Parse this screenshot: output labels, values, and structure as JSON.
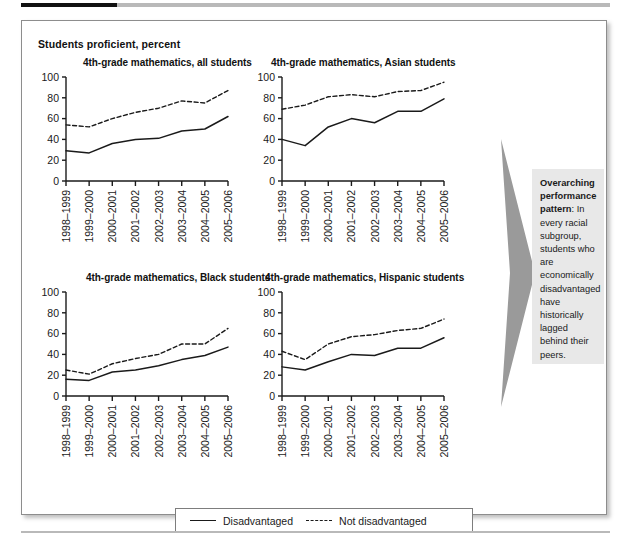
{
  "figure": {
    "axis_super_label": "Students proficient, percent",
    "legend": {
      "disadvantaged_label": "Disadvantaged",
      "not_disadvantaged_label": "Not disadvantaged"
    },
    "callout": {
      "lead": "Overarching performance pattern",
      "body": ": In every racial subgroup, students who are economically disadvantaged have historically lagged behind their peers."
    },
    "colors": {
      "line": "#1a1a1a",
      "arrow": "#9a9a9a",
      "callout_bg": "#e8e8e8",
      "rule_dark": "#111111",
      "rule_light": "#b9b9b9"
    }
  },
  "chart_data": [
    {
      "type": "line",
      "title": "4th-grade mathematics, all students",
      "xlabel": "",
      "ylabel": "Students proficient, percent",
      "ylim": [
        0,
        100
      ],
      "yticks": [
        0,
        20,
        40,
        60,
        80,
        100
      ],
      "grid": false,
      "legend_position": "below-figure",
      "categories": [
        "1998–1999",
        "1999–2000",
        "2000–2001",
        "2001–2002",
        "2002–2003",
        "2003–2004",
        "2004–2005",
        "2005–2006"
      ],
      "series": [
        {
          "name": "Disadvantaged",
          "style": "solid",
          "values": [
            29,
            27,
            36,
            40,
            41,
            48,
            50,
            62
          ]
        },
        {
          "name": "Not disadvantaged",
          "style": "dashed",
          "values": [
            54,
            52,
            60,
            66,
            70,
            77,
            75,
            87
          ]
        }
      ]
    },
    {
      "type": "line",
      "title": "4th-grade mathematics, Asian students",
      "xlabel": "",
      "ylabel": "Students proficient, percent",
      "ylim": [
        0,
        100
      ],
      "yticks": [
        0,
        20,
        40,
        60,
        80,
        100
      ],
      "grid": false,
      "legend_position": "below-figure",
      "categories": [
        "1998–1999",
        "1999–2000",
        "2000–2001",
        "2001–2002",
        "2002–2003",
        "2003–2004",
        "2004–2005",
        "2005–2006"
      ],
      "series": [
        {
          "name": "Disadvantaged",
          "style": "solid",
          "values": [
            40,
            34,
            52,
            60,
            56,
            67,
            67,
            79
          ]
        },
        {
          "name": "Not disadvantaged",
          "style": "dashed",
          "values": [
            69,
            73,
            81,
            83,
            81,
            86,
            87,
            95
          ]
        }
      ]
    },
    {
      "type": "line",
      "title": "4th-grade mathematics, Black students",
      "xlabel": "",
      "ylabel": "Students proficient, percent",
      "ylim": [
        0,
        100
      ],
      "yticks": [
        0,
        20,
        40,
        60,
        80,
        100
      ],
      "grid": false,
      "legend_position": "below-figure",
      "categories": [
        "1998–1999",
        "1999–2000",
        "2000–2001",
        "2001–2002",
        "2002–2003",
        "2003–2004",
        "2004–2005",
        "2005–2006"
      ],
      "series": [
        {
          "name": "Disadvantaged",
          "style": "solid",
          "values": [
            16,
            15,
            23,
            25,
            29,
            35,
            39,
            47
          ]
        },
        {
          "name": "Not disadvantaged",
          "style": "dashed",
          "values": [
            25,
            21,
            31,
            36,
            40,
            50,
            50,
            65
          ]
        }
      ]
    },
    {
      "type": "line",
      "title": "4th-grade mathematics, Hispanic students",
      "xlabel": "",
      "ylabel": "Students proficient, percent",
      "ylim": [
        0,
        100
      ],
      "yticks": [
        0,
        20,
        40,
        60,
        80,
        100
      ],
      "grid": false,
      "legend_position": "below-figure",
      "categories": [
        "1998–1999",
        "1999–2000",
        "2000–2001",
        "2001–2002",
        "2002–2003",
        "2003–2004",
        "2004–2005",
        "2005–2006"
      ],
      "series": [
        {
          "name": "Disadvantaged",
          "style": "solid",
          "values": [
            28,
            25,
            33,
            40,
            39,
            46,
            46,
            56
          ]
        },
        {
          "name": "Not disadvantaged",
          "style": "dashed",
          "values": [
            43,
            35,
            50,
            57,
            59,
            63,
            65,
            74
          ]
        }
      ]
    }
  ]
}
